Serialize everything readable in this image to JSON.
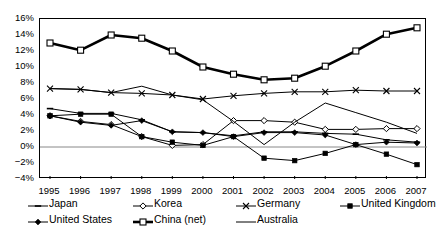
{
  "chart_data": {
    "type": "line",
    "title": "",
    "subtitle": "",
    "xlabel": "",
    "ylabel": "",
    "grid": false,
    "legend_position": "bottom",
    "categories": [
      "1995",
      "1996",
      "1997",
      "1998",
      "1999",
      "2000",
      "2001",
      "2002",
      "2003",
      "2004",
      "2005",
      "2006",
      "2007"
    ],
    "x": [
      1995,
      1996,
      1997,
      1998,
      1999,
      2000,
      2001,
      2002,
      2003,
      2004,
      2005,
      2006,
      2007
    ],
    "ylim": [
      -4,
      16
    ],
    "ytick_values": [
      16,
      14,
      12,
      10,
      8,
      6,
      4,
      2,
      0,
      -2,
      -4
    ],
    "ytick_labels": [
      "16%",
      "14%",
      "12%",
      "10%",
      "8%",
      "6%",
      "4%",
      "2%",
      "0%",
      "-2%",
      "-4%"
    ],
    "xtick_labels": [
      "1995",
      "1996",
      "1997",
      "1998",
      "1999",
      "2000",
      "2001",
      "2002",
      "2003",
      "2004",
      "2005",
      "2006",
      "2007"
    ],
    "value_unit": "%",
    "series": [
      {
        "name": "Japan",
        "marker": "dash",
        "line_width": 1,
        "color": "#000000",
        "values": [
          4.8,
          4.2,
          4.2,
          3.4,
          1.9,
          1.8,
          1.4,
          1.9,
          1.9,
          1.7,
          1.6,
          0.9,
          0.6
        ]
      },
      {
        "name": "Korea",
        "marker": "open-diamond",
        "line_width": 1,
        "color": "#000000",
        "values": [
          3.9,
          3.2,
          2.8,
          1.3,
          0.2,
          0.3,
          3.3,
          3.3,
          3.1,
          2.2,
          2.2,
          2.3,
          2.3
        ]
      },
      {
        "name": "Germany",
        "marker": "x-star",
        "line_width": 1,
        "color": "#000000",
        "values": [
          7.3,
          7.2,
          6.8,
          6.7,
          6.5,
          6.0,
          6.4,
          6.7,
          6.9,
          6.9,
          7.1,
          7.0,
          7.0
        ]
      },
      {
        "name": "United Kingdom",
        "marker": "filled-square",
        "line_width": 1,
        "color": "#000000",
        "values": [
          3.9,
          4.1,
          4.1,
          1.3,
          0.6,
          0.2,
          1.3,
          -1.4,
          -1.7,
          -0.8,
          0.3,
          -0.9,
          -2.2
        ]
      },
      {
        "name": "United States",
        "marker": "filled-diamond",
        "line_width": 1,
        "color": "#000000",
        "values": [
          3.9,
          3.1,
          2.7,
          3.3,
          1.9,
          1.8,
          1.3,
          1.8,
          1.8,
          1.5,
          0.3,
          0.6,
          0.5
        ]
      },
      {
        "name": "China (net)",
        "marker": "open-square",
        "line_width": 2.6,
        "color": "#000000",
        "values": [
          13.0,
          12.1,
          14.0,
          13.6,
          12.0,
          10.0,
          9.1,
          8.4,
          8.6,
          10.1,
          12.0,
          14.1,
          14.9
        ]
      },
      {
        "name": "Australia",
        "marker": "none",
        "line_width": 1,
        "color": "#000000",
        "values": [
          7.3,
          7.2,
          6.8,
          7.6,
          6.5,
          5.9,
          3.2,
          0.3,
          3.1,
          5.5,
          4.3,
          3.1,
          1.7
        ]
      }
    ]
  },
  "legend": {
    "row1": [
      {
        "label": "Japan",
        "marker": "dash"
      },
      {
        "label": "Korea",
        "marker": "open-diamond"
      },
      {
        "label": "Germany",
        "marker": "x-star"
      },
      {
        "label": "United Kingdom",
        "marker": "filled-square"
      }
    ],
    "row2": [
      {
        "label": "United States",
        "marker": "filled-diamond"
      },
      {
        "label": "China (net)",
        "marker": "open-square"
      },
      {
        "label": "Australia",
        "marker": "none"
      }
    ]
  }
}
